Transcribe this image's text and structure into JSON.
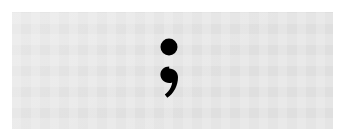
{
  "image": {
    "width": 345,
    "height": 138,
    "outer_background_color": "#ffffff",
    "plate_background_color": "#e2e2e2",
    "alt_text": "A black semicolon punctuation mark centered on a light gray background"
  },
  "plate": {
    "left": 12,
    "top": 12,
    "width": 321,
    "height": 117
  },
  "glyph": {
    "character": ";",
    "name": "semicolon",
    "unicode": "U+003B",
    "color": "#000000",
    "center_x": 169,
    "top": 39,
    "bottom": 100,
    "parts": [
      {
        "name": "upper-dot",
        "shape": "circle",
        "center_x": 169,
        "center_y": 47,
        "radius": 8.5
      },
      {
        "name": "lower-comma",
        "shape": "comma",
        "head_center_x": 169,
        "head_center_y": 77,
        "head_radius": 8.5,
        "tail_end_x": 164,
        "tail_end_y": 100
      }
    ]
  }
}
